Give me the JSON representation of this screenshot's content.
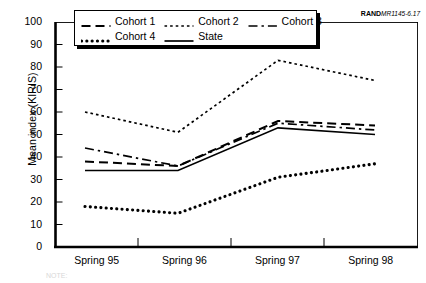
{
  "source_stamp": {
    "brand": "RAND",
    "code": "MR1145-6.17"
  },
  "axes": {
    "ylabel": "Mean index (KIRIS)",
    "yticks": [
      "100",
      "90",
      "80",
      "70",
      "60",
      "50",
      "40",
      "30",
      "20",
      "10",
      "0"
    ],
    "xticks": [
      "Spring 95",
      "Spring 96",
      "Spring 97",
      "Spring 98"
    ]
  },
  "legend": {
    "rows": [
      [
        {
          "label": "Cohort 1",
          "key": "dashed-line-key"
        },
        {
          "label": "Cohort 2",
          "key": "dotted-fine-line-key"
        },
        {
          "label": "Cohort 3",
          "key": "dash-dot-line-key"
        }
      ],
      [
        {
          "label": "Cohort 4",
          "key": "dotted-thick-line-key"
        },
        {
          "label": "State",
          "key": "solid-line-key"
        }
      ]
    ]
  },
  "note": "NOTE:",
  "chart_data": {
    "type": "line",
    "title": "",
    "xlabel": "",
    "ylabel": "Mean index (KIRIS)",
    "categories": [
      "Spring 95",
      "Spring 96",
      "Spring 97",
      "Spring 98"
    ],
    "ylim": [
      0,
      100
    ],
    "ytick_step": 10,
    "grid": false,
    "legend_position": "top-center",
    "series": [
      {
        "name": "Cohort 1",
        "style": "dashed",
        "values": [
          38,
          36,
          56,
          54
        ]
      },
      {
        "name": "Cohort 2",
        "style": "dotted-fine",
        "values": [
          60,
          51,
          83,
          74
        ]
      },
      {
        "name": "Cohort 3",
        "style": "dash-dot",
        "values": [
          44,
          36,
          55,
          52
        ]
      },
      {
        "name": "Cohort 4",
        "style": "dotted-thick",
        "values": [
          18,
          15,
          31,
          37
        ]
      },
      {
        "name": "State",
        "style": "solid",
        "values": [
          34,
          34,
          53,
          50
        ]
      }
    ]
  }
}
